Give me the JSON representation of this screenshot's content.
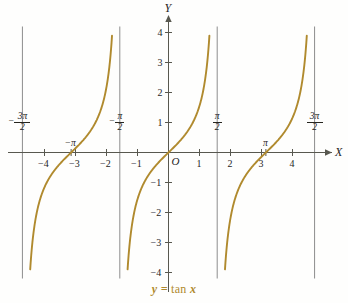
{
  "figure": {
    "caption": "y = tan x",
    "caption_function": "tan",
    "caption_lhs": "y =",
    "caption_var": "x",
    "background_color": "#fefefd",
    "curve_color": "#b08a2e",
    "asymptote_color": "#8d8d8d",
    "axis_color": "#58584f"
  },
  "axes": {
    "x_axis_name": "X",
    "y_axis_name": "Y",
    "origin_label": "O",
    "x_tick_labels": [
      "−4",
      "−3",
      "−2",
      "−1",
      "1",
      "2",
      "3",
      "4"
    ],
    "y_tick_labels": [
      "4",
      "3",
      "2",
      "1",
      "−1",
      "−2",
      "−3",
      "−4"
    ]
  },
  "asymptote_labels": [
    {
      "name": "neg-three-pi-over-two",
      "minus": "−",
      "numerator": "3π",
      "denominator": "2"
    },
    {
      "name": "neg-pi-over-two",
      "minus": "−",
      "numerator": "π",
      "denominator": "2"
    },
    {
      "name": "pi-over-two",
      "minus": "",
      "numerator": "π",
      "denominator": "2"
    },
    {
      "name": "three-pi-over-two",
      "minus": "",
      "numerator": "3π",
      "denominator": "2"
    }
  ],
  "special_x_labels": [
    {
      "name": "neg-pi",
      "text": "−π"
    },
    {
      "name": "pi",
      "text": "π"
    }
  ],
  "chart_data": {
    "type": "line",
    "title": "y = tan x",
    "xlabel": "X",
    "ylabel": "Y",
    "xlim": [
      -5.1,
      5.3
    ],
    "ylim": [
      -4,
      4
    ],
    "grid": false,
    "legend": "none",
    "function": "y = tan(x)",
    "x_ticks": [
      -4,
      -3,
      -2,
      -1,
      1,
      2,
      3,
      4
    ],
    "y_ticks": [
      4,
      3,
      2,
      1,
      -1,
      -2,
      -3,
      -4
    ],
    "asymptotes_x": [
      -4.71238898038469,
      -1.570796326794897,
      1.570796326794897,
      4.71238898038469
    ],
    "asymptote_tick_values": [
      "-3pi/2",
      "-pi/2",
      "pi/2",
      "3pi/2"
    ],
    "zero_crossings_x": [
      -3.141592653589793,
      0,
      3.141592653589793
    ],
    "zero_crossing_labels": [
      "-pi",
      "0",
      "pi"
    ],
    "branches": [
      {
        "name": "branch-left",
        "x_range": [
          -4.71238898038469,
          -1.570796326794897
        ],
        "points": [
          {
            "x": -4.465,
            "y": -4.0
          },
          {
            "x": -4.463,
            "y": -3.5
          },
          {
            "x": -4.424,
            "y": -3.0
          },
          {
            "x": -4.369,
            "y": -2.5
          },
          {
            "x": -4.284,
            "y": -2.0
          },
          {
            "x": -4.159,
            "y": -1.5
          },
          {
            "x": -3.927,
            "y": -1.0
          },
          {
            "x": -3.605,
            "y": -0.5
          },
          {
            "x": -3.142,
            "y": 0.0
          },
          {
            "x": -2.678,
            "y": 0.5
          },
          {
            "x": -2.356,
            "y": 1.0
          },
          {
            "x": -2.124,
            "y": 1.5
          },
          {
            "x": -1.999,
            "y": 2.0
          },
          {
            "x": -1.914,
            "y": 2.5
          },
          {
            "x": -1.859,
            "y": 3.0
          },
          {
            "x": -1.82,
            "y": 3.5
          },
          {
            "x": -1.816,
            "y": 4.0
          }
        ]
      },
      {
        "name": "branch-center",
        "x_range": [
          -1.570796326794897,
          1.570796326794897
        ],
        "points": [
          {
            "x": -1.326,
            "y": -4.0
          },
          {
            "x": -1.292,
            "y": -3.5
          },
          {
            "x": -1.249,
            "y": -3.0
          },
          {
            "x": -1.19,
            "y": -2.5
          },
          {
            "x": -1.107,
            "y": -2.0
          },
          {
            "x": -0.983,
            "y": -1.5
          },
          {
            "x": -0.785,
            "y": -1.0
          },
          {
            "x": -0.464,
            "y": -0.5
          },
          {
            "x": 0.0,
            "y": 0.0
          },
          {
            "x": 0.464,
            "y": 0.5
          },
          {
            "x": 0.785,
            "y": 1.0
          },
          {
            "x": 0.983,
            "y": 1.5
          },
          {
            "x": 1.107,
            "y": 2.0
          },
          {
            "x": 1.19,
            "y": 2.5
          },
          {
            "x": 1.249,
            "y": 3.0
          },
          {
            "x": 1.292,
            "y": 3.5
          },
          {
            "x": 1.326,
            "y": 4.0
          }
        ]
      },
      {
        "name": "branch-right",
        "x_range": [
          1.570796326794897,
          4.71238898038469
        ],
        "points": [
          {
            "x": 1.816,
            "y": -4.0
          },
          {
            "x": 1.85,
            "y": -3.5
          },
          {
            "x": 1.893,
            "y": -3.0
          },
          {
            "x": 1.952,
            "y": -2.5
          },
          {
            "x": 2.034,
            "y": -2.0
          },
          {
            "x": 2.159,
            "y": -1.5
          },
          {
            "x": 2.356,
            "y": -1.0
          },
          {
            "x": 2.678,
            "y": -0.5
          },
          {
            "x": 3.142,
            "y": 0.0
          },
          {
            "x": 3.605,
            "y": 0.5
          },
          {
            "x": 3.927,
            "y": 1.0
          },
          {
            "x": 4.124,
            "y": 1.5
          },
          {
            "x": 4.249,
            "y": 2.0
          },
          {
            "x": 4.332,
            "y": 2.5
          },
          {
            "x": 4.391,
            "y": 3.0
          },
          {
            "x": 4.434,
            "y": 3.5
          },
          {
            "x": 4.467,
            "y": 4.0
          }
        ]
      }
    ]
  }
}
